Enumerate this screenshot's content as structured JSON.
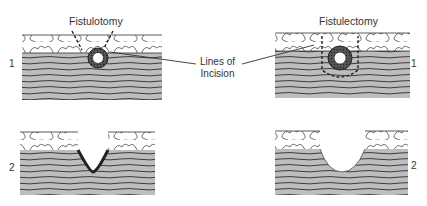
{
  "diagram": {
    "panels": [
      {
        "title": "Fistulotomy",
        "step1_label": "1",
        "step2_label": "2"
      },
      {
        "title": "Fistulectomy",
        "step1_label": "1",
        "step2_label": "2"
      }
    ],
    "callout": {
      "line1": "Lines of",
      "line2": "Incision"
    },
    "colors": {
      "muscle_fill": "#b9b9b9",
      "stroke": "#2b2b2b",
      "tract": "#3a3a3a",
      "background": "#ffffff"
    }
  }
}
